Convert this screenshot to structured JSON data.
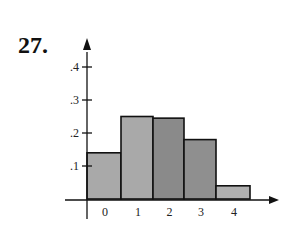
{
  "problem_number": "27.",
  "chart_data": {
    "type": "bar",
    "title": "",
    "xlabel": "",
    "ylabel": "",
    "categories": [
      "0",
      "1",
      "2",
      "3",
      "4"
    ],
    "values": [
      0.14,
      0.25,
      0.245,
      0.18,
      0.04
    ],
    "bar_colors": [
      "#a9a9a9",
      "#a9a9a9",
      "#8a8a8a",
      "#8f8f8f",
      "#b0b0b0"
    ],
    "ylim": [
      0,
      0.45
    ],
    "yticks": [
      ".1",
      ".2",
      ".3",
      ".4"
    ],
    "ytick_values": [
      0.1,
      0.2,
      0.3,
      0.4
    ],
    "grid": false,
    "legend": null,
    "style": "histogram"
  }
}
